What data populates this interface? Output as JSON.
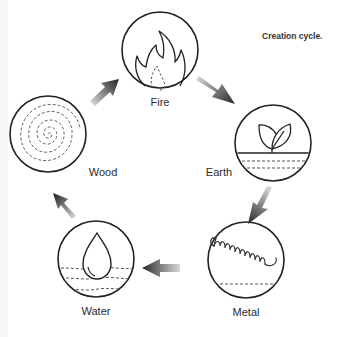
{
  "caption": "Creation cycle.",
  "colors": {
    "stroke": "#222222",
    "dash": "#555555",
    "arrow_dark": "#2a2a2a",
    "arrow_light": "#d8d8d8",
    "background": "#ffffff"
  },
  "elements": [
    {
      "id": "fire",
      "label": "Fire",
      "icon": "flame-icon",
      "cx": 160,
      "cy": 50,
      "r": 38,
      "label_x": 160,
      "label_y": 96
    },
    {
      "id": "earth",
      "label": "Earth",
      "icon": "leaf-sprout-icon",
      "cx": 273,
      "cy": 143,
      "r": 38,
      "label_x": 219,
      "label_y": 166
    },
    {
      "id": "metal",
      "label": "Metal",
      "icon": "spring-coil-icon",
      "cx": 246,
      "cy": 260,
      "r": 38,
      "label_x": 246,
      "label_y": 306
    },
    {
      "id": "water",
      "label": "Water",
      "icon": "water-drop-icon",
      "cx": 96,
      "cy": 259,
      "r": 38,
      "label_x": 96,
      "label_y": 305
    },
    {
      "id": "wood",
      "label": "Wood",
      "icon": "tree-rings-icon",
      "cx": 48,
      "cy": 134,
      "r": 38,
      "label_x": 103,
      "label_y": 166
    }
  ],
  "arrows": [
    {
      "from": "fire",
      "to": "earth"
    },
    {
      "from": "earth",
      "to": "metal"
    },
    {
      "from": "metal",
      "to": "water"
    },
    {
      "from": "water",
      "to": "wood"
    },
    {
      "from": "wood",
      "to": "fire"
    }
  ]
}
